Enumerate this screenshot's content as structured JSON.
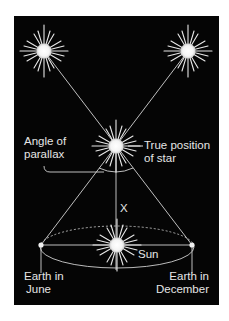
{
  "diagram": {
    "colors": {
      "background": "#050505",
      "lines": "#d8d8d8",
      "text": "#e6e6e6",
      "page": "#ffffff"
    },
    "labels": {
      "angle_of_parallax_line1": "Angle of",
      "angle_of_parallax_line2": "parallax",
      "true_position_line1": "True position",
      "true_position_line2": "of star",
      "distance": "X",
      "sun": "Sun",
      "earth_june_line1": "Earth in",
      "earth_june_line2": "June",
      "earth_december_line1": "Earth in",
      "earth_december_line2": "December"
    },
    "nodes": [
      {
        "id": "apparent-star-left",
        "type": "star",
        "x": 44,
        "y": 51
      },
      {
        "id": "apparent-star-right",
        "type": "star",
        "x": 188,
        "y": 51
      },
      {
        "id": "true-star",
        "type": "star",
        "x": 116,
        "y": 146
      },
      {
        "id": "sun",
        "type": "star",
        "x": 117,
        "y": 245
      },
      {
        "id": "earth-june",
        "type": "dot",
        "x": 41,
        "y": 245
      },
      {
        "id": "earth-december",
        "type": "dot",
        "x": 192,
        "y": 245
      }
    ],
    "edges": [
      {
        "from": "earth-december",
        "to": "apparent-star-left",
        "via": "true-star"
      },
      {
        "from": "earth-june",
        "to": "apparent-star-right",
        "via": "true-star"
      },
      {
        "from": "true-star",
        "to": "sun",
        "label": "X"
      },
      {
        "from": "earth-june",
        "to": "earth-december"
      }
    ],
    "orbit": {
      "cx": 117,
      "cy": 247,
      "rx": 77,
      "ry": 21,
      "top_style": "dashed",
      "bottom_style": "solid"
    }
  }
}
